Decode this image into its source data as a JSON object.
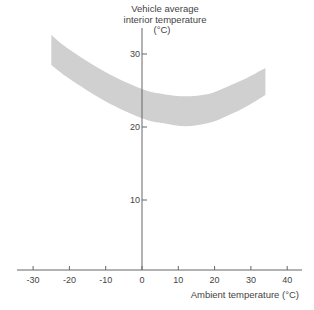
{
  "chart_data": {
    "type": "area",
    "title": "",
    "xlabel": "Ambient temperature (°C)",
    "ylabel": "Vehicle average interior temperature (°C)",
    "ylabel_lines": [
      "Vehicle average",
      "interior temperature",
      "(°C)"
    ],
    "x_ticks": [
      -30,
      -20,
      -10,
      0,
      10,
      20,
      30,
      40
    ],
    "y_ticks": [
      10,
      20,
      30
    ],
    "xlim": [
      -35,
      44
    ],
    "ylim": [
      0,
      33
    ],
    "grid": false,
    "legend": null,
    "series": [
      {
        "name": "Comfort band upper bound",
        "x": [
          -25,
          -20,
          -10,
          0,
          6,
          12,
          18,
          22,
          28,
          34
        ],
        "values": [
          32.6,
          30.6,
          27.5,
          25.2,
          24.5,
          24.2,
          24.5,
          25.2,
          26.5,
          28.1
        ]
      },
      {
        "name": "Comfort band lower bound",
        "x": [
          -25,
          -20,
          -10,
          0,
          6,
          12,
          18,
          22,
          28,
          34
        ],
        "values": [
          28.5,
          26.6,
          23.5,
          21.2,
          20.5,
          20.1,
          20.5,
          21.2,
          22.6,
          24.4
        ]
      }
    ],
    "band_color": "#d0d0d0",
    "axis_color": "#666666"
  }
}
